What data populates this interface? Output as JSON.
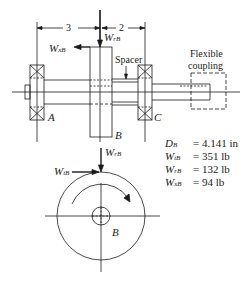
{
  "diagram": {
    "type": "shaft-gear-bearing assembly",
    "dimensions": {
      "left_span": "3",
      "right_span": "2"
    },
    "labels": {
      "bearing_left": "A",
      "gear": "B",
      "bearing_right": "C",
      "spacer": "Spacer",
      "coupling_line1": "Flexible",
      "coupling_line2": "coupling",
      "gear_end_view": "B"
    },
    "forces": {
      "axial": {
        "symbol": "W",
        "subscript": "xB"
      },
      "radial": {
        "symbol": "W",
        "subscript": "rB"
      },
      "tangential": {
        "symbol": "W",
        "subscript": "tB"
      }
    },
    "specs": [
      {
        "symbol": "D",
        "subscript": "B",
        "value": "= 4.141 in"
      },
      {
        "symbol": "W",
        "subscript": "tB",
        "value": "= 351 lb"
      },
      {
        "symbol": "W",
        "subscript": "rB",
        "value": "= 132 lb"
      },
      {
        "symbol": "W",
        "subscript": "xB",
        "value": "= 94 lb"
      }
    ],
    "colors": {
      "line": "#1a1a1a",
      "background": "#ffffff"
    }
  }
}
